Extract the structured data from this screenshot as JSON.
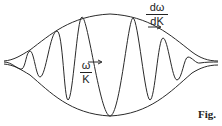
{
  "diagram": {
    "labels": {
      "group_velocity": {
        "numerator": "dω",
        "denominator": "dK"
      },
      "phase_velocity": {
        "numerator": "ω",
        "denominator": "K"
      },
      "figure_caption": "Fig."
    },
    "colors": {
      "stroke": "#2a2a2a",
      "background": "#ffffff"
    }
  }
}
